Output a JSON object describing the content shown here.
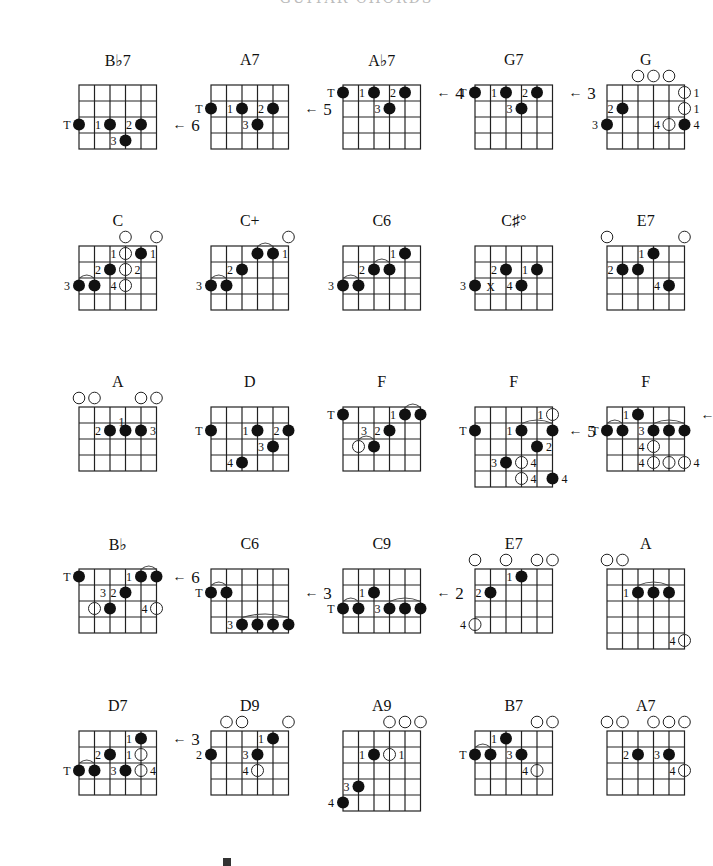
{
  "page": {
    "header_text": "GUITAR CHORDS",
    "footer_mark": "E"
  },
  "layout": {
    "col_x": [
      52,
      184,
      316,
      448,
      580
    ],
    "row_y": [
      55,
      216,
      377,
      539,
      701
    ],
    "title_offset": 0,
    "grid_offset": 30,
    "cell_w": 15.5,
    "cell_h": 16
  },
  "chords": [
    {
      "id": "bb7",
      "title": "B♭7",
      "col": 0,
      "row": 0,
      "frets": 4,
      "dots": [
        {
          "s": 0,
          "f": 2,
          "fill": true,
          "label": "T"
        },
        {
          "s": 2,
          "f": 2,
          "fill": true,
          "label": "1"
        },
        {
          "s": 4,
          "f": 2,
          "fill": true,
          "label": "2"
        },
        {
          "s": 3,
          "f": 3,
          "fill": true,
          "label": "3"
        }
      ],
      "arrow": {
        "f": 2,
        "label": "6"
      }
    },
    {
      "id": "a7-1",
      "title": "A7",
      "col": 1,
      "row": 0,
      "frets": 4,
      "dots": [
        {
          "s": 0,
          "f": 1,
          "fill": true,
          "label": "T"
        },
        {
          "s": 2,
          "f": 1,
          "fill": true,
          "label": "1"
        },
        {
          "s": 4,
          "f": 1,
          "fill": true,
          "label": "2"
        },
        {
          "s": 3,
          "f": 2,
          "fill": true,
          "label": "3"
        }
      ],
      "arrow": {
        "f": 1,
        "label": "5"
      }
    },
    {
      "id": "ab7",
      "title": "A♭7",
      "col": 2,
      "row": 0,
      "frets": 4,
      "dots": [
        {
          "s": 0,
          "f": 0,
          "fill": true,
          "label": "T"
        },
        {
          "s": 2,
          "f": 0,
          "fill": true,
          "label": "1"
        },
        {
          "s": 4,
          "f": 0,
          "fill": true,
          "label": "2"
        },
        {
          "s": 3,
          "f": 1,
          "fill": true,
          "label": "3"
        }
      ],
      "arrow": {
        "f": 0,
        "label": "4"
      }
    },
    {
      "id": "g7",
      "title": "G7",
      "col": 3,
      "row": 0,
      "frets": 4,
      "dots": [
        {
          "s": 0,
          "f": 0,
          "fill": true,
          "label": "T"
        },
        {
          "s": 2,
          "f": 0,
          "fill": true,
          "label": "1"
        },
        {
          "s": 4,
          "f": 0,
          "fill": true,
          "label": "2"
        },
        {
          "s": 3,
          "f": 1,
          "fill": true,
          "label": "3"
        }
      ],
      "arrow": {
        "f": 0,
        "label": "3"
      }
    },
    {
      "id": "g",
      "title": "G",
      "col": 4,
      "row": 0,
      "frets": 4,
      "open": [
        2,
        3,
        4
      ],
      "dots": [
        {
          "s": 5,
          "f": 0,
          "fill": false,
          "label": "1",
          "side": "r"
        },
        {
          "s": 5,
          "f": 1,
          "fill": false,
          "label": "1",
          "side": "r"
        },
        {
          "s": 1,
          "f": 1,
          "fill": true,
          "label": "2"
        },
        {
          "s": 0,
          "f": 2,
          "fill": true,
          "label": "3"
        },
        {
          "s": 4,
          "f": 2,
          "fill": false,
          "label": "4"
        },
        {
          "s": 5,
          "f": 2,
          "fill": true,
          "label": "4",
          "side": "r"
        }
      ]
    },
    {
      "id": "c",
      "title": "C",
      "col": 0,
      "row": 1,
      "frets": 4,
      "open": [
        3,
        5
      ],
      "dots": [
        {
          "s": 3,
          "f": 0,
          "fill": false,
          "label": "1"
        },
        {
          "s": 4,
          "f": 0,
          "fill": true,
          "label": "1",
          "side": "r"
        },
        {
          "s": 2,
          "f": 1,
          "fill": true,
          "label": "2"
        },
        {
          "s": 3,
          "f": 1,
          "fill": false,
          "label": "2",
          "side": "r"
        },
        {
          "s": 0,
          "f": 2,
          "fill": true,
          "label": "3"
        },
        {
          "s": 1,
          "f": 2,
          "fill": true
        },
        {
          "s": 3,
          "f": 2,
          "fill": false,
          "label": "4"
        }
      ],
      "barres": [
        {
          "f": 2,
          "from": 0,
          "to": 1
        }
      ]
    },
    {
      "id": "c-aug",
      "title": "C+",
      "col": 1,
      "row": 1,
      "frets": 4,
      "open": [
        5
      ],
      "dots": [
        {
          "s": 3,
          "f": 0,
          "fill": true
        },
        {
          "s": 4,
          "f": 0,
          "fill": true,
          "label": "1",
          "side": "r"
        },
        {
          "s": 2,
          "f": 1,
          "fill": true,
          "label": "2"
        },
        {
          "s": 0,
          "f": 2,
          "fill": true,
          "label": "3"
        },
        {
          "s": 1,
          "f": 2,
          "fill": true
        }
      ],
      "barres": [
        {
          "f": 0,
          "from": 3,
          "to": 4
        },
        {
          "f": 2,
          "from": 0,
          "to": 1
        }
      ]
    },
    {
      "id": "c6-1",
      "title": "C6",
      "col": 2,
      "row": 1,
      "frets": 4,
      "dots": [
        {
          "s": 4,
          "f": 0,
          "fill": true,
          "label": "1"
        },
        {
          "s": 2,
          "f": 1,
          "fill": true,
          "label": "2"
        },
        {
          "s": 3,
          "f": 1,
          "fill": true
        },
        {
          "s": 0,
          "f": 2,
          "fill": true,
          "label": "3"
        },
        {
          "s": 1,
          "f": 2,
          "fill": true
        }
      ],
      "barres": [
        {
          "f": 1,
          "from": 2,
          "to": 3
        },
        {
          "f": 2,
          "from": 0,
          "to": 1
        }
      ]
    },
    {
      "id": "csharp-dim",
      "title": "C♯°",
      "col": 3,
      "row": 1,
      "frets": 4,
      "dots": [
        {
          "s": 2,
          "f": 1,
          "fill": true,
          "label": "2"
        },
        {
          "s": 4,
          "f": 1,
          "fill": true,
          "label": "1"
        },
        {
          "s": 0,
          "f": 2,
          "fill": true,
          "label": "3"
        },
        {
          "s": 3,
          "f": 2,
          "fill": true,
          "label": "4"
        }
      ],
      "mutes": [
        {
          "s": 1,
          "f": 2
        }
      ]
    },
    {
      "id": "e7-1",
      "title": "E7",
      "col": 4,
      "row": 1,
      "frets": 4,
      "open": [
        0,
        5
      ],
      "dots": [
        {
          "s": 3,
          "f": 0,
          "fill": true,
          "label": "1"
        },
        {
          "s": 1,
          "f": 1,
          "fill": true,
          "label": "2"
        },
        {
          "s": 2,
          "f": 1,
          "fill": true
        },
        {
          "s": 4,
          "f": 2,
          "fill": true,
          "label": "4"
        }
      ]
    },
    {
      "id": "a-1",
      "title": "A",
      "col": 0,
      "row": 2,
      "frets": 4,
      "open": [
        0,
        1,
        4,
        5
      ],
      "dots": [
        {
          "s": 2,
          "f": 1,
          "fill": true,
          "label": "2"
        },
        {
          "s": 3,
          "f": 1,
          "fill": true,
          "label": "1",
          "side": "t"
        },
        {
          "s": 4,
          "f": 1,
          "fill": true,
          "label": "3",
          "side": "r"
        }
      ]
    },
    {
      "id": "d",
      "title": "D",
      "col": 1,
      "row": 2,
      "frets": 4,
      "dots": [
        {
          "s": 0,
          "f": 1,
          "fill": true,
          "label": "T"
        },
        {
          "s": 3,
          "f": 1,
          "fill": true,
          "label": "1"
        },
        {
          "s": 5,
          "f": 1,
          "fill": true,
          "label": "2"
        },
        {
          "s": 4,
          "f": 2,
          "fill": true,
          "label": "3"
        },
        {
          "s": 2,
          "f": 3,
          "fill": true,
          "label": "4"
        }
      ]
    },
    {
      "id": "f-1",
      "title": "F",
      "col": 2,
      "row": 2,
      "frets": 4,
      "dots": [
        {
          "s": 0,
          "f": 0,
          "fill": true,
          "label": "T"
        },
        {
          "s": 4,
          "f": 0,
          "fill": true,
          "label": "1"
        },
        {
          "s": 5,
          "f": 0,
          "fill": true
        },
        {
          "s": 3,
          "f": 1,
          "fill": true,
          "label": "2"
        },
        {
          "s": 1,
          "f": 2,
          "fill": false
        },
        {
          "s": 2,
          "f": 2,
          "fill": true
        }
      ],
      "labels": [
        {
          "s": 2,
          "f": 1,
          "text": "3",
          "dx": -10
        }
      ],
      "barres": [
        {
          "f": 0,
          "from": 4,
          "to": 5
        },
        {
          "f": 2,
          "from": 1,
          "to": 2
        }
      ]
    },
    {
      "id": "f-2",
      "title": "F",
      "col": 3,
      "row": 2,
      "frets": 5,
      "dots": [
        {
          "s": 5,
          "f": 0,
          "fill": false,
          "label": "1"
        },
        {
          "s": 0,
          "f": 1,
          "fill": true,
          "label": "T"
        },
        {
          "s": 3,
          "f": 1,
          "fill": true,
          "label": "1"
        },
        {
          "s": 5,
          "f": 1,
          "fill": true
        },
        {
          "s": 4,
          "f": 2,
          "fill": true,
          "label": "2",
          "side": "r"
        },
        {
          "s": 2,
          "f": 3,
          "fill": true,
          "label": "3"
        },
        {
          "s": 3,
          "f": 3,
          "fill": false,
          "label": "4",
          "side": "r"
        },
        {
          "s": 3,
          "f": 4,
          "fill": false,
          "label": "4",
          "side": "r"
        },
        {
          "s": 5,
          "f": 4,
          "fill": true,
          "label": "4",
          "side": "r"
        }
      ],
      "barres": [
        {
          "f": 1,
          "from": 3,
          "to": 5
        }
      ],
      "arrow": {
        "f": 1,
        "label": "5"
      }
    },
    {
      "id": "f-3",
      "title": "F",
      "col": 4,
      "row": 2,
      "frets": 4,
      "dots": [
        {
          "s": 2,
          "f": 0,
          "fill": true,
          "label": "1"
        },
        {
          "s": 0,
          "f": 1,
          "fill": true,
          "label": "T"
        },
        {
          "s": 1,
          "f": 1,
          "fill": true
        },
        {
          "s": 3,
          "f": 1,
          "fill": true,
          "label": "3"
        },
        {
          "s": 4,
          "f": 1,
          "fill": true
        },
        {
          "s": 5,
          "f": 1,
          "fill": true
        },
        {
          "s": 3,
          "f": 2,
          "fill": false,
          "label": "4"
        },
        {
          "s": 3,
          "f": 3,
          "fill": false,
          "label": "4"
        },
        {
          "s": 4,
          "f": 3,
          "fill": false
        },
        {
          "s": 5,
          "f": 3,
          "fill": false,
          "label": "4",
          "side": "r"
        }
      ],
      "barres": [
        {
          "f": 1,
          "from": 0,
          "to": 1
        },
        {
          "f": 1,
          "from": 3,
          "to": 5
        }
      ],
      "arrow": {
        "f": 0,
        "label": "7"
      }
    },
    {
      "id": "bb",
      "title": "B♭",
      "col": 0,
      "row": 3,
      "frets": 4,
      "dots": [
        {
          "s": 0,
          "f": 0,
          "fill": true,
          "label": "T"
        },
        {
          "s": 4,
          "f": 0,
          "fill": true,
          "label": "1"
        },
        {
          "s": 5,
          "f": 0,
          "fill": true
        },
        {
          "s": 3,
          "f": 1,
          "fill": true,
          "label": "2"
        },
        {
          "s": 1,
          "f": 2,
          "fill": false
        },
        {
          "s": 2,
          "f": 2,
          "fill": true
        },
        {
          "s": 5,
          "f": 2,
          "fill": false,
          "label": "4"
        }
      ],
      "labels": [
        {
          "s": 2,
          "f": 1,
          "text": "3",
          "dx": -7
        }
      ],
      "barres": [
        {
          "f": 0,
          "from": 4,
          "to": 5
        }
      ],
      "arrow": {
        "f": 0,
        "label": "6"
      }
    },
    {
      "id": "c6-2",
      "title": "C6",
      "col": 1,
      "row": 3,
      "frets": 4,
      "dots": [
        {
          "s": 0,
          "f": 1,
          "fill": true,
          "label": "T"
        },
        {
          "s": 1,
          "f": 1,
          "fill": true
        },
        {
          "s": 2,
          "f": 3,
          "fill": true,
          "label": "3"
        },
        {
          "s": 3,
          "f": 3,
          "fill": true
        },
        {
          "s": 4,
          "f": 3,
          "fill": true
        },
        {
          "s": 5,
          "f": 3,
          "fill": true
        }
      ],
      "barres": [
        {
          "f": 1,
          "from": 0,
          "to": 1
        },
        {
          "f": 3,
          "from": 2,
          "to": 5
        }
      ],
      "arrow": {
        "f": 1,
        "label": "3"
      }
    },
    {
      "id": "c9",
      "title": "C9",
      "col": 2,
      "row": 3,
      "frets": 4,
      "dots": [
        {
          "s": 2,
          "f": 1,
          "fill": true,
          "label": "1"
        },
        {
          "s": 0,
          "f": 2,
          "fill": true,
          "label": "T"
        },
        {
          "s": 1,
          "f": 2,
          "fill": true
        },
        {
          "s": 3,
          "f": 2,
          "fill": true,
          "label": "3"
        },
        {
          "s": 4,
          "f": 2,
          "fill": true
        },
        {
          "s": 5,
          "f": 2,
          "fill": true
        }
      ],
      "barres": [
        {
          "f": 2,
          "from": 0,
          "to": 1
        },
        {
          "f": 2,
          "from": 3,
          "to": 5
        }
      ],
      "arrow": {
        "f": 1,
        "label": "2"
      }
    },
    {
      "id": "e7-2",
      "title": "E7",
      "col": 3,
      "row": 3,
      "frets": 4,
      "open": [
        0,
        2,
        4,
        5
      ],
      "dots": [
        {
          "s": 3,
          "f": 0,
          "fill": true,
          "label": "1"
        },
        {
          "s": 1,
          "f": 1,
          "fill": true,
          "label": "2"
        },
        {
          "s": 0,
          "f": 3,
          "fill": false,
          "label": "4"
        }
      ]
    },
    {
      "id": "a-2",
      "title": "A",
      "col": 4,
      "row": 3,
      "frets": 5,
      "open": [
        0,
        1
      ],
      "dots": [
        {
          "s": 2,
          "f": 1,
          "fill": true,
          "label": "1"
        },
        {
          "s": 3,
          "f": 1,
          "fill": true
        },
        {
          "s": 4,
          "f": 1,
          "fill": true
        },
        {
          "s": 5,
          "f": 4,
          "fill": false,
          "label": "4"
        }
      ],
      "barres": [
        {
          "f": 1,
          "from": 2,
          "to": 4
        }
      ]
    },
    {
      "id": "d7",
      "title": "D7",
      "col": 0,
      "row": 4,
      "frets": 4,
      "dots": [
        {
          "s": 4,
          "f": 0,
          "fill": true,
          "label": "1"
        },
        {
          "s": 2,
          "f": 1,
          "fill": true,
          "label": "2"
        },
        {
          "s": 4,
          "f": 1,
          "fill": false,
          "label": "1"
        },
        {
          "s": 0,
          "f": 2,
          "fill": true,
          "label": "T"
        },
        {
          "s": 1,
          "f": 2,
          "fill": true
        },
        {
          "s": 3,
          "f": 2,
          "fill": true,
          "label": "3"
        },
        {
          "s": 4,
          "f": 2,
          "fill": false,
          "label": "4",
          "side": "r"
        }
      ],
      "barres": [
        {
          "f": 2,
          "from": 0,
          "to": 1
        }
      ],
      "arrow": {
        "f": 0,
        "label": "3"
      }
    },
    {
      "id": "d9",
      "title": "D9",
      "col": 1,
      "row": 4,
      "frets": 4,
      "open": [
        1,
        2,
        5
      ],
      "dots": [
        {
          "s": 4,
          "f": 0,
          "fill": true,
          "label": "1"
        },
        {
          "s": 0,
          "f": 1,
          "fill": true,
          "label": "2"
        },
        {
          "s": 3,
          "f": 1,
          "fill": true,
          "label": "3"
        },
        {
          "s": 3,
          "f": 2,
          "fill": false,
          "label": "4"
        }
      ]
    },
    {
      "id": "a9",
      "title": "A9",
      "col": 2,
      "row": 4,
      "frets": 5,
      "open": [
        3,
        4,
        5
      ],
      "dots": [
        {
          "s": 2,
          "f": 1,
          "fill": true,
          "label": "1"
        },
        {
          "s": 3,
          "f": 1,
          "fill": false,
          "label": "1",
          "side": "r"
        },
        {
          "s": 1,
          "f": 3,
          "fill": true,
          "label": "3"
        },
        {
          "s": 0,
          "f": 4,
          "fill": true,
          "label": "4"
        }
      ]
    },
    {
      "id": "b7",
      "title": "B7",
      "col": 3,
      "row": 4,
      "frets": 4,
      "open": [
        4,
        5
      ],
      "dots": [
        {
          "s": 2,
          "f": 0,
          "fill": true,
          "label": "1"
        },
        {
          "s": 0,
          "f": 1,
          "fill": true,
          "label": "T"
        },
        {
          "s": 1,
          "f": 1,
          "fill": true
        },
        {
          "s": 3,
          "f": 1,
          "fill": true,
          "label": "3"
        },
        {
          "s": 4,
          "f": 2,
          "fill": false,
          "label": "4"
        }
      ],
      "barres": [
        {
          "f": 1,
          "from": 0,
          "to": 1
        }
      ]
    },
    {
      "id": "a7-2",
      "title": "A7",
      "col": 4,
      "row": 4,
      "frets": 4,
      "open": [
        0,
        1,
        3,
        4,
        5
      ],
      "dots": [
        {
          "s": 2,
          "f": 1,
          "fill": true,
          "label": "2"
        },
        {
          "s": 4,
          "f": 1,
          "fill": true,
          "label": "3"
        },
        {
          "s": 5,
          "f": 2,
          "fill": false,
          "label": "4"
        }
      ]
    }
  ]
}
